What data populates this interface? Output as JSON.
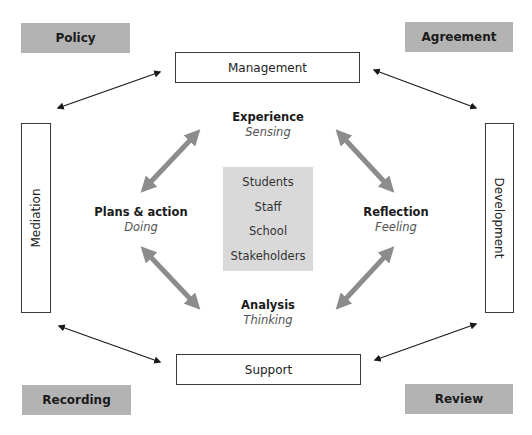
{
  "corners": {
    "top_left": "Policy",
    "top_right": "Agreement",
    "bottom_left": "Recording",
    "bottom_right": "Review"
  },
  "frames": {
    "top": "Management",
    "bottom": "Support",
    "left": "Mediation",
    "right": "Development"
  },
  "cycle": {
    "top": {
      "title": "Experience",
      "subtitle": "Sensing"
    },
    "right": {
      "title": "Reflection",
      "subtitle": "Feeling"
    },
    "bottom": {
      "title": "Analysis",
      "subtitle": "Thinking"
    },
    "left": {
      "title": "Plans & action",
      "subtitle": "Doing"
    }
  },
  "center": {
    "items": [
      "Students",
      "Staff",
      "School",
      "Stakeholders"
    ]
  },
  "colors": {
    "corner_fill": "#b3b3b3",
    "center_fill": "#d9d9d9",
    "cycle_arrow": "#8c8c8c",
    "connector_arrow": "#1a1a1a"
  }
}
